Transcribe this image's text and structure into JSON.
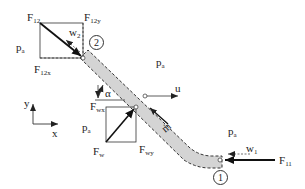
{
  "diagram": {
    "type": "free-body diagram of pipe bend with fluid flow",
    "colors": {
      "pipe_fill": "#d4d4d4",
      "line": "#222222",
      "background": "#ffffff"
    },
    "labels": {
      "F12": {
        "main": "F",
        "sub": "12"
      },
      "F12y": {
        "main": "F",
        "sub": "12y"
      },
      "F12x": {
        "main": "F",
        "sub": "12x"
      },
      "w2": {
        "main": "w",
        "sub": "2"
      },
      "pa_left_top": {
        "main": "p",
        "sub": "a"
      },
      "pa_top_right": {
        "main": "p",
        "sub": "a"
      },
      "pa_mid_left": {
        "main": "p",
        "sub": "a"
      },
      "pa_right": {
        "main": "p",
        "sub": "a"
      },
      "Fwx": {
        "main": "F",
        "sub": "wx"
      },
      "Fw": {
        "main": "F",
        "sub": "w"
      },
      "Fwy": {
        "main": "F",
        "sub": "wy"
      },
      "alpha": "α",
      "u": "u",
      "mdot": "ṁ",
      "w1": {
        "main": "w",
        "sub": "1"
      },
      "F11": {
        "main": "F",
        "sub": "11"
      },
      "axis_x": "x",
      "axis_y": "y",
      "section_1": "1",
      "section_2": "2"
    }
  }
}
